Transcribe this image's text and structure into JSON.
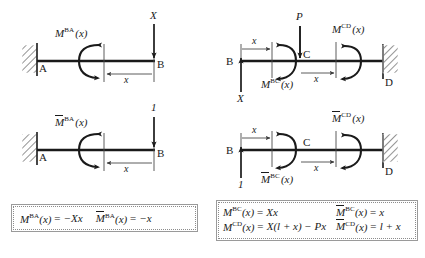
{
  "figure": {
    "panels": [
      {
        "id": "top-left",
        "description": "Cantilever A-B with downward force X at free end B, section cut at distance x from B, internal moment M^BA(x)",
        "support_label": "A",
        "free_end_label": "B",
        "load_label": "X",
        "moment_label_base": "M",
        "moment_label_sup": "BA",
        "moment_label_arg": "(x)",
        "dimension_label": "x"
      },
      {
        "id": "bottom-left",
        "description": "Same cantilever A-B with unit downward force 1 at B, internal moment Mbar^BA(x)",
        "support_label": "A",
        "free_end_label": "B",
        "load_label": "1",
        "moment_label_base": "M",
        "moment_label_sup": "BA",
        "moment_label_arg": "(x)",
        "moment_overbar": true,
        "dimension_label": "x"
      },
      {
        "id": "top-right",
        "description": "Beam B-C-D fixed at D, upward reaction X at B, downward force P at C, two section cuts with moments M^BC(x) and M^CD(x)",
        "left_end_label": "B",
        "mid_node_label": "C",
        "support_label": "D",
        "reaction_label": "X",
        "load_label": "P",
        "moment_bc_base": "M",
        "moment_bc_sup": "BC",
        "moment_bc_arg": "(x)",
        "moment_cd_base": "M",
        "moment_cd_sup": "CD",
        "moment_cd_arg": "(x)",
        "dimension_label_left": "x",
        "dimension_label_right": "x"
      },
      {
        "id": "bottom-right",
        "description": "Beam B-C-D fixed at D with unit upward force 1 at B, moments Mbar^BC(x) and Mbar^CD(x)",
        "left_end_label": "B",
        "mid_node_label": "C",
        "support_label": "D",
        "reaction_label": "1",
        "moment_bc_base": "M",
        "moment_bc_sup": "BC",
        "moment_bc_arg": "(x)",
        "moment_cd_base": "M",
        "moment_cd_sup": "CD",
        "moment_cd_arg": "(x)",
        "moment_overbar": true,
        "dimension_label_left": "x",
        "dimension_label_right": "x"
      }
    ]
  },
  "equation_box_left": {
    "rows": [
      {
        "cells": [
          {
            "base": "M",
            "sup": "BA",
            "arg": "(x)",
            "overbar": false,
            "rhs": "= −Xx"
          },
          {
            "base": "M",
            "sup": "BA",
            "arg": "(x)",
            "overbar": true,
            "rhs": "= −x"
          }
        ]
      }
    ]
  },
  "equation_box_right": {
    "rows": [
      {
        "cells": [
          {
            "base": "M",
            "sup": "BC",
            "arg": "(x)",
            "overbar": false,
            "rhs": "= Xx"
          },
          {
            "base": "M",
            "sup": "BC",
            "arg": "(x)",
            "overbar": true,
            "rhs": "= x"
          }
        ]
      },
      {
        "cells": [
          {
            "base": "M",
            "sup": "CD",
            "arg": "(x)",
            "overbar": false,
            "rhs": "= X(l + x) − Px"
          },
          {
            "base": "M",
            "sup": "CD",
            "arg": "(x)",
            "overbar": true,
            "rhs": "= l + x"
          }
        ]
      }
    ]
  },
  "colors": {
    "ink": "#1a1a1a",
    "beam": "#1a1a1a",
    "thin": "#4a4a4a",
    "box_border": "#9a9a9a",
    "background": "#ffffff"
  }
}
